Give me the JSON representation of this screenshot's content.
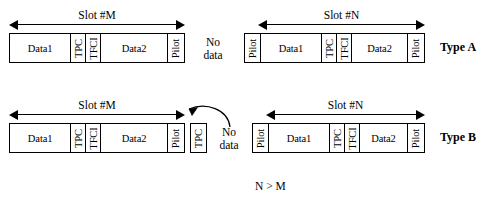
{
  "figure": {
    "relation_note": "N > M",
    "no_data_label": "No\ndata"
  },
  "rows": [
    {
      "type_label": "Type A",
      "left_slot": {
        "dim_label": "Slot #M",
        "cells": [
          {
            "label": "Data1",
            "orientation": "horizontal"
          },
          {
            "label": "TPC",
            "orientation": "vertical"
          },
          {
            "label": "TFCI",
            "orientation": "vertical"
          },
          {
            "label": "Data2",
            "orientation": "horizontal"
          },
          {
            "label": "Pilot",
            "orientation": "vertical"
          }
        ]
      },
      "right_slot": {
        "dim_label": "Slot #N",
        "cells": [
          {
            "label": "Pilot",
            "orientation": "vertical"
          },
          {
            "label": "Data1",
            "orientation": "horizontal"
          },
          {
            "label": "TPC",
            "orientation": "vertical"
          },
          {
            "label": "TFCI",
            "orientation": "vertical"
          },
          {
            "label": "Data2",
            "orientation": "horizontal"
          },
          {
            "label": "Pilot",
            "orientation": "vertical"
          }
        ]
      },
      "gap": {
        "no_data": "No\ndata",
        "has_tpc_box": false,
        "has_curved_arrow": false
      }
    },
    {
      "type_label": "Type B",
      "left_slot": {
        "dim_label": "Slot #M",
        "cells": [
          {
            "label": "Data1",
            "orientation": "horizontal"
          },
          {
            "label": "TPC",
            "orientation": "vertical"
          },
          {
            "label": "TFCI",
            "orientation": "vertical"
          },
          {
            "label": "Data2",
            "orientation": "horizontal"
          },
          {
            "label": "Pilot",
            "orientation": "vertical"
          }
        ]
      },
      "right_slot": {
        "dim_label": "Slot #N",
        "cells": [
          {
            "label": "Pilot",
            "orientation": "vertical"
          },
          {
            "label": "Data1",
            "orientation": "horizontal"
          },
          {
            "label": "TPC",
            "orientation": "vertical"
          },
          {
            "label": "TFCI",
            "orientation": "vertical"
          },
          {
            "label": "Data2",
            "orientation": "horizontal"
          },
          {
            "label": "Pilot",
            "orientation": "vertical"
          }
        ]
      },
      "gap": {
        "no_data": "No\ndata",
        "tpc_box_label": "TPC",
        "has_tpc_box": true,
        "has_curved_arrow": true
      }
    }
  ],
  "colors": {
    "stroke": "#000000",
    "background": "#ffffff"
  }
}
